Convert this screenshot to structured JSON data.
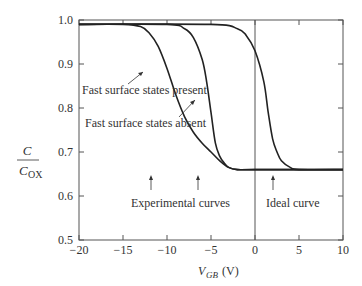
{
  "chart_data": {
    "type": "line",
    "title": "",
    "xlabel": "V_GB (V)",
    "xlabel_main": "V",
    "xlabel_sub": "GB",
    "xlabel_unit": "(V)",
    "ylabel_num": "C",
    "ylabel_den_main": "C",
    "ylabel_den_sub": "OX",
    "xlim": [
      -20,
      10
    ],
    "ylim": [
      0.5,
      1.0
    ],
    "xticks": [
      -20,
      -15,
      -10,
      -5,
      0,
      5,
      10
    ],
    "xtick_labels": [
      "−20",
      "−15",
      "−10",
      "−5",
      "0",
      "5",
      "10"
    ],
    "yticks": [
      0.5,
      0.6,
      0.7,
      0.8,
      0.9,
      1.0
    ],
    "ytick_labels": [
      "0.5",
      "0.6",
      "0.7",
      "0.8",
      "0.9",
      "1.0"
    ],
    "grid": false,
    "series": [
      {
        "name": "Fast surface states present",
        "x": [
          -20,
          -15,
          -13,
          -12,
          -11,
          -10,
          -9,
          -8,
          -7,
          -6,
          -5,
          -4,
          -3,
          -2,
          0,
          10
        ],
        "y": [
          0.99,
          0.99,
          0.985,
          0.97,
          0.94,
          0.89,
          0.83,
          0.78,
          0.745,
          0.72,
          0.7,
          0.68,
          0.665,
          0.66,
          0.66,
          0.66
        ]
      },
      {
        "name": "Fast surface states absent",
        "x": [
          -20,
          -10,
          -8,
          -7,
          -6,
          -5.5,
          -5,
          -4.5,
          -4,
          -3.5,
          -3,
          -2,
          0,
          10
        ],
        "y": [
          0.99,
          0.99,
          0.98,
          0.96,
          0.91,
          0.86,
          0.79,
          0.72,
          0.69,
          0.675,
          0.665,
          0.66,
          0.66,
          0.66
        ]
      },
      {
        "name": "Ideal curve",
        "x": [
          -20,
          -5,
          -2,
          -1,
          0,
          1,
          1.5,
          2,
          2.5,
          3,
          4,
          5,
          10
        ],
        "y": [
          0.99,
          0.99,
          0.98,
          0.965,
          0.93,
          0.86,
          0.79,
          0.73,
          0.7,
          0.68,
          0.665,
          0.66,
          0.66
        ]
      }
    ],
    "annotations": [
      "Fast surface states present",
      "Fast surface states absent",
      "Experimental curves",
      "Ideal curve"
    ]
  }
}
